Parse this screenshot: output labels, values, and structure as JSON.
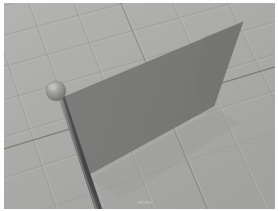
{
  "viewport": {
    "label": "3d-render-viewport",
    "background_color": "#ffffff",
    "frame_color": "#fdfdfd",
    "width": 278,
    "height": 211
  },
  "ground": {
    "label": "perspective-grid-ground-plane",
    "base_color": "#a9aaa8",
    "highlight_color": "#b6b7b4",
    "shadow_color": "#9a9b99",
    "grid_line_color": "#8e8f8d",
    "grid_line_light_color": "#b9bab7",
    "axis_line_color": "#6f706e",
    "description": "Receding checkered grid floor seen from a high camera angle"
  },
  "flag": {
    "label": "flag-cloth-plane",
    "fill_color": "#797a78",
    "edge_color": "#6b6c6a",
    "shadow_color": "#8b8c8a",
    "weave_color": "#707270",
    "corners": {
      "top_left": {
        "x": 64,
        "y": 97
      },
      "top_right": {
        "x": 243,
        "y": 22
      },
      "bottom_right": {
        "x": 214,
        "y": 106
      },
      "bottom_left": {
        "x": 88,
        "y": 175
      }
    }
  },
  "pole": {
    "label": "flag-pole",
    "shaft_color": "#6e6f6d",
    "shaft_dark_color": "#48494a",
    "shaft_light_color": "#8b8c8a",
    "top": {
      "x": 57,
      "y": 96
    },
    "bottom": {
      "x": 96,
      "y": 211
    },
    "thickness": 5
  },
  "finial": {
    "label": "pole-sphere-finial",
    "center": {
      "x": 56,
      "y": 91
    },
    "radius": 10,
    "fill_color": "#969795",
    "highlight_color": "#b4b5b2",
    "shade_color": "#6d6e6c"
  },
  "watermark": {
    "label": "render-watermark",
    "text": "render"
  }
}
